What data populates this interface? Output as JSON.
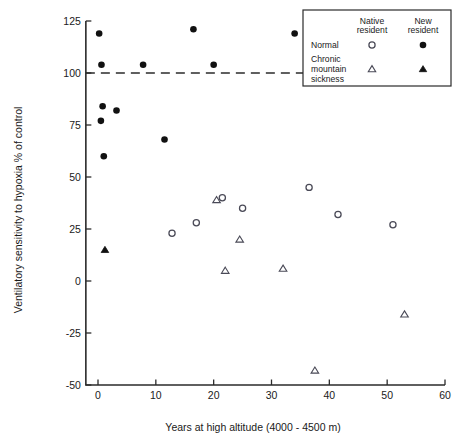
{
  "chart_data": {
    "type": "scatter",
    "title": "",
    "xlabel": "Years at high altitude  (4000 - 4500 m)",
    "ylabel": "Ventilatory sensitivity to hypoxia % of control",
    "xlim": [
      -2,
      60
    ],
    "ylim": [
      -50,
      125
    ],
    "xticks": [
      0,
      10,
      20,
      30,
      40,
      50,
      60
    ],
    "xticklabels": [
      "0",
      "10",
      "20",
      "30",
      "40",
      "50",
      "60"
    ],
    "yticks": [
      -50,
      -25,
      0,
      25,
      50,
      75,
      100,
      125
    ],
    "yticklabels": [
      "-50",
      "-25",
      "0",
      "25",
      "50",
      "75",
      "100",
      "125"
    ],
    "grid": false,
    "legend_position": "top-right",
    "annotations": [
      {
        "name": "control-reference-line",
        "type": "hline",
        "y": 100,
        "style": "dashed",
        "label": "100% of control"
      }
    ],
    "series": [
      {
        "name": "Normal - New resident",
        "marker": "filled-circle",
        "group": "Normal",
        "residency": "New resident",
        "points": [
          {
            "x": 0.2,
            "y": 119
          },
          {
            "x": 0.6,
            "y": 104
          },
          {
            "x": 0.8,
            "y": 84
          },
          {
            "x": 0.5,
            "y": 77
          },
          {
            "x": 1.0,
            "y": 60
          },
          {
            "x": 3.2,
            "y": 82
          },
          {
            "x": 7.8,
            "y": 104
          },
          {
            "x": 11.5,
            "y": 68
          },
          {
            "x": 16.5,
            "y": 121
          },
          {
            "x": 20.0,
            "y": 104
          },
          {
            "x": 34.0,
            "y": 119
          }
        ]
      },
      {
        "name": "Normal - Native resident",
        "marker": "open-circle",
        "group": "Normal",
        "residency": "Native resident",
        "points": [
          {
            "x": 12.8,
            "y": 23
          },
          {
            "x": 17.0,
            "y": 28
          },
          {
            "x": 21.5,
            "y": 40
          },
          {
            "x": 25.0,
            "y": 35
          },
          {
            "x": 36.5,
            "y": 45
          },
          {
            "x": 41.5,
            "y": 32
          },
          {
            "x": 51.0,
            "y": 27
          }
        ]
      },
      {
        "name": "Chronic mountain sickness - New resident",
        "marker": "filled-triangle",
        "group": "Chronic mountain sickness",
        "residency": "New resident",
        "points": [
          {
            "x": 1.2,
            "y": 15
          }
        ]
      },
      {
        "name": "Chronic mountain sickness - Native resident",
        "marker": "open-triangle",
        "group": "Chronic mountain sickness",
        "residency": "Native resident",
        "points": [
          {
            "x": 20.5,
            "y": 39
          },
          {
            "x": 22.0,
            "y": 5
          },
          {
            "x": 24.5,
            "y": 20
          },
          {
            "x": 32.0,
            "y": 6
          },
          {
            "x": 37.5,
            "y": -43
          },
          {
            "x": 53.0,
            "y": -16
          }
        ]
      }
    ]
  },
  "legend": {
    "col_headers": [
      "Native\nresident",
      "New\nresident"
    ],
    "col1_line1": "Native",
    "col1_line2": "resident",
    "col2_line1": "New",
    "col2_line2": "resident",
    "rows": [
      {
        "label_lines": [
          "Normal"
        ],
        "native_marker": "open-circle",
        "new_marker": "filled-circle"
      },
      {
        "label_lines": [
          "Chronic",
          "mountain",
          "sickness"
        ],
        "native_marker": "open-triangle",
        "new_marker": "filled-triangle"
      }
    ],
    "row1_l1": "Normal",
    "row2_l1": "Chronic",
    "row2_l2": "mountain",
    "row2_l3": "sickness"
  }
}
